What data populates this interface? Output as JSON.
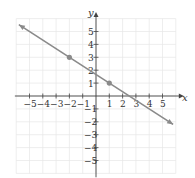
{
  "chart_data": {
    "type": "line",
    "title": "",
    "xlabel": "x",
    "ylabel": "y",
    "xlim": [
      -6,
      6
    ],
    "ylim": [
      -6,
      6
    ],
    "grid": true,
    "x_ticks": [
      -5,
      -4,
      -3,
      -2,
      -1,
      1,
      2,
      3,
      4,
      5
    ],
    "y_ticks": [
      -5,
      -4,
      -3,
      -2,
      -1,
      1,
      2,
      3,
      4,
      5
    ],
    "x_tick_labels": [
      "−5",
      "−4",
      "−3",
      "−2",
      "−1",
      "1",
      "2",
      "3",
      "4",
      "5"
    ],
    "y_tick_labels": [
      "−5",
      "−4",
      "−3",
      "−2",
      "−1",
      "1",
      "2",
      "3",
      "4",
      "5"
    ],
    "series": [
      {
        "name": "line",
        "slope": -0.6667,
        "intercept": 1.6667,
        "x": [
          -5.8,
          5.8
        ],
        "y": [
          5.53,
          -2.2
        ],
        "arrows": "both",
        "color": "#8a8a8a"
      }
    ],
    "points": [
      {
        "x": -2,
        "y": 3
      },
      {
        "x": 1,
        "y": 1
      }
    ]
  },
  "colors": {
    "line": "#8a8a8a",
    "grid": "#e6e6e6",
    "axis": "#444444",
    "point": "#8a8a8a"
  }
}
